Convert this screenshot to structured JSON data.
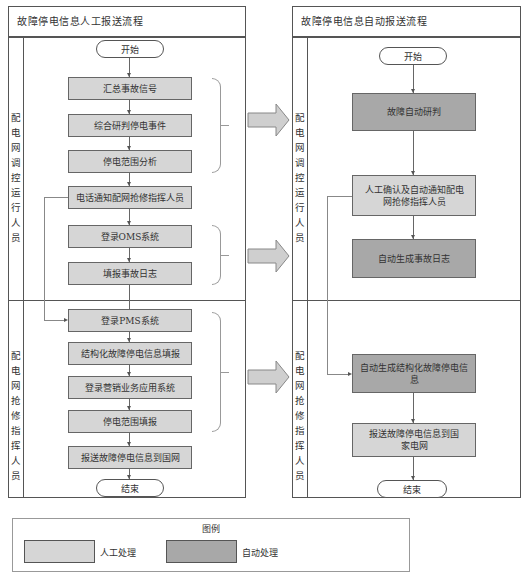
{
  "left_panel": {
    "title": "故障停电信息人工报送流程",
    "lanes": [
      {
        "label_chars": [
          "配",
          "电",
          "网",
          "调",
          "控",
          "运",
          "行",
          "人",
          "员"
        ]
      },
      {
        "label_chars": [
          "配",
          "电",
          "网",
          "抢",
          "修",
          "指",
          "挥",
          "人",
          "员"
        ]
      }
    ],
    "start": "开始",
    "end": "结束",
    "steps": [
      {
        "label": "汇总事故信号",
        "type": "manual"
      },
      {
        "label": "综合研判停电事件",
        "type": "manual"
      },
      {
        "label": "停电范围分析",
        "type": "manual"
      },
      {
        "label": "电话通知配网抢修指挥人员",
        "type": "manual"
      },
      {
        "label": "登录OMS系统",
        "type": "manual"
      },
      {
        "label": "填报事故日志",
        "type": "manual"
      },
      {
        "label": "登录PMS系统",
        "type": "manual"
      },
      {
        "label": "结构化故障停电信息填报",
        "type": "manual"
      },
      {
        "label": "登录营销业务应用系统",
        "type": "manual"
      },
      {
        "label": "停电范围填报",
        "type": "manual"
      },
      {
        "label": "报送故障停电信息到国网",
        "type": "manual"
      }
    ]
  },
  "right_panel": {
    "title": "故障停电信息自动报送流程",
    "lanes": [
      {
        "label_chars": [
          "配",
          "电",
          "网",
          "调",
          "控",
          "运",
          "行",
          "人",
          "员"
        ]
      },
      {
        "label_chars": [
          "配",
          "电",
          "网",
          "抢",
          "修",
          "指",
          "挥",
          "人",
          "员"
        ]
      }
    ],
    "start": "开始",
    "end": "结束",
    "steps": [
      {
        "label": "故障自动研判",
        "type": "auto"
      },
      {
        "label": "人工确认及自动通知配电网抢修指挥人员",
        "type": "manual"
      },
      {
        "label": "自动生成事故日志",
        "type": "auto"
      },
      {
        "label": "自动生成结构化故障停电信息",
        "type": "auto"
      },
      {
        "label": "报送故障停电信息到国家电网",
        "type": "manual"
      }
    ]
  },
  "transform_arrows": 3,
  "legend": {
    "title": "图例",
    "items": [
      {
        "label": "人工处理",
        "color": "#d6d6d6"
      },
      {
        "label": "自动处理",
        "color": "#a8a8a8"
      }
    ]
  },
  "colors": {
    "manual": "#d6d6d6",
    "auto": "#a8a8a8",
    "border": "#555555",
    "arrow_fill": "#cccccc"
  }
}
